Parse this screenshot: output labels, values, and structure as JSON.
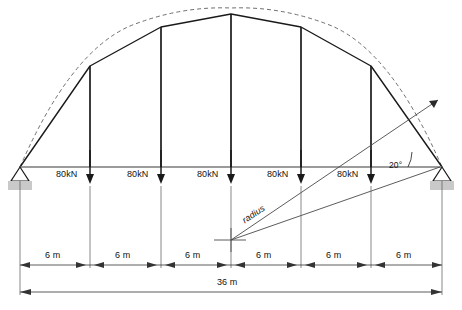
{
  "diagram": {
    "type": "structural-engineering-line-diagram",
    "colors": {
      "member": "#1a1a1a",
      "tie_beam": "#777777",
      "dashed_arc": "#666666",
      "dimension": "#333333",
      "support_fill": "#c9c9c9",
      "background": "#ffffff"
    }
  },
  "loads": {
    "label": "80kN",
    "count": 5,
    "direction": "down",
    "items": [
      {
        "label": "80kN",
        "x": 90
      },
      {
        "label": "80kN",
        "x": 161
      },
      {
        "label": "80kN",
        "x": 231
      },
      {
        "label": "80kN",
        "x": 301
      },
      {
        "label": "80kN",
        "x": 371
      }
    ]
  },
  "angle": {
    "value": "20°",
    "at": "right-support",
    "between": "tie-beam and radius line"
  },
  "radius": {
    "label": "radius",
    "center_x": 231,
    "center_y": 240
  },
  "dimensions": {
    "segments": [
      {
        "label": "6 m"
      },
      {
        "label": "6 m"
      },
      {
        "label": "6 m"
      },
      {
        "label": "6 m"
      },
      {
        "label": "6 m"
      },
      {
        "label": "6 m"
      }
    ],
    "total": {
      "label": "36 m"
    }
  },
  "supports": {
    "left": {
      "name": "pin-support",
      "x": 20
    },
    "right": {
      "name": "pin-support",
      "x": 442
    }
  },
  "geometry": {
    "span_px": 422,
    "tie_y": 167,
    "nodes": [
      {
        "x": 20,
        "y": 167
      },
      {
        "x": 90,
        "y": 66
      },
      {
        "x": 161,
        "y": 27
      },
      {
        "x": 231,
        "y": 14
      },
      {
        "x": 301,
        "y": 27
      },
      {
        "x": 371,
        "y": 66
      },
      {
        "x": 442,
        "y": 167
      }
    ]
  }
}
